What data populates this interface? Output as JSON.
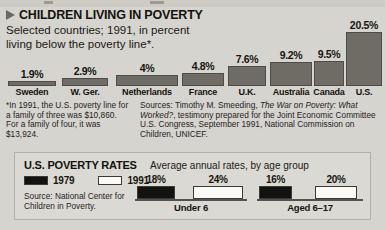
{
  "header": {
    "marker_icon": "triangle-right-icon",
    "title": "CHILDREN LIVING IN POVERTY",
    "subtitle": "Selected countries; 1991, in percent living below the poverty line*."
  },
  "footnote": "*In 1991, the U.S. poverty line for a family of three was $10,860. For a family of four, it was $13,924.",
  "sources": {
    "prefix": "Sources:  Timothy M. Smeeding, ",
    "italic1": "The War on Poverty: What Worked?",
    "suffix": ", testimony prepared for the Joint Economic Committee U.S. Congress, September 1991, National Commission on Children, UNICEF."
  },
  "bottom": {
    "title": "U.S. POVERTY RATES",
    "subtitle": "Average annual rates, by age group",
    "legend": [
      {
        "label": "1979",
        "swatch": "black"
      },
      {
        "label": "1991",
        "swatch": "white"
      }
    ],
    "source": "Source: National Center for Children in Poverty."
  },
  "chart_data": [
    {
      "type": "bar",
      "title": "CHILDREN LIVING IN POVERTY",
      "subtitle": "Selected countries; 1991, in percent living below the poverty line*.",
      "xlabel": "",
      "ylabel": "Percent living below the poverty line",
      "ylim": [
        0,
        20.5
      ],
      "grid": false,
      "legend": "none",
      "categories": [
        "Sweden",
        "W. Ger.",
        "Netherlands",
        "France",
        "U.K.",
        "Australia",
        "Canada",
        "U.S."
      ],
      "values": [
        1.9,
        2.9,
        4,
        4.8,
        7.6,
        9.2,
        9.5,
        20.5
      ],
      "value_labels": [
        "1.9%",
        "2.9%",
        "4%",
        "4.8%",
        "7.6%",
        "9.2%",
        "9.5%",
        "20.5%"
      ]
    },
    {
      "type": "bar",
      "title": "U.S. POVERTY RATES",
      "subtitle": "Average annual rates, by age group",
      "xlabel": "",
      "ylabel": "Percent",
      "ylim": [
        0,
        24
      ],
      "grid": false,
      "legend": "top-left",
      "categories": [
        "Under 6",
        "Aged 6-17"
      ],
      "series": [
        {
          "name": "1979",
          "values": [
            18,
            16
          ],
          "value_labels": [
            "18%",
            "16%"
          ]
        },
        {
          "name": "1991",
          "values": [
            24,
            20
          ],
          "value_labels": [
            "24%",
            "20%"
          ]
        }
      ]
    }
  ]
}
